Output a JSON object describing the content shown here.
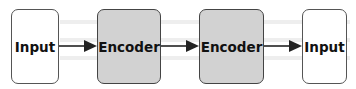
{
  "diagram": {
    "nodes": [
      {
        "id": "input-1",
        "label": "Input",
        "type": "input"
      },
      {
        "id": "encoder-1",
        "label": "Encoder",
        "type": "encoder"
      },
      {
        "id": "encoder-2",
        "label": "Encoder",
        "type": "encoder"
      },
      {
        "id": "input-2",
        "label": "Input",
        "type": "input"
      }
    ],
    "edges": [
      {
        "from": "input-1",
        "to": "encoder-1"
      },
      {
        "from": "encoder-1",
        "to": "encoder-2"
      },
      {
        "from": "encoder-2",
        "to": "input-2"
      }
    ],
    "colors": {
      "input_fill": "#ffffff",
      "encoder_fill": "#d2d2d2",
      "border": "#555555",
      "arrow": "#222222"
    }
  }
}
